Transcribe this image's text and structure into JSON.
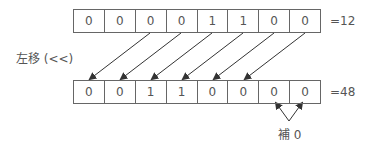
{
  "diagram": {
    "operation_label": "左移 (<<)",
    "before": {
      "bits": [
        "0",
        "0",
        "0",
        "0",
        "1",
        "1",
        "0",
        "0"
      ],
      "value_label": "=12"
    },
    "after": {
      "bits": [
        "0",
        "0",
        "1",
        "1",
        "0",
        "0",
        "0",
        "0"
      ],
      "value_label": "=48"
    },
    "padding_label": "補 0",
    "shift_amount": 2,
    "colors": {
      "line": "#333333",
      "text": "#555555",
      "border": "#666666"
    }
  }
}
